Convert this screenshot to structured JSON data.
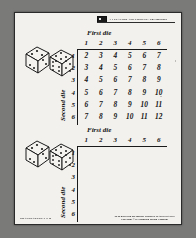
{
  "page": {
    "header": {
      "logo_icon": "publisher-logo-icon",
      "text": "A-1 TEACHER AND STUDENT / The Publisher"
    },
    "footer_left": "TRANSPARENCY 5-B",
    "footer_right_line1": "To be used with the Teacher Edition of MATHEMATICS",
    "footer_right_line2": "Copyright © by Houghton Mifflin Company"
  },
  "tables": [
    {
      "id": "sums-table-filled",
      "title": "First die",
      "side_label": "Second die",
      "columns": [
        "1",
        "2",
        "3",
        "4",
        "5",
        "6"
      ],
      "rows": [
        "1",
        "2",
        "3",
        "4",
        "5",
        "6"
      ],
      "cells": [
        [
          "2",
          "3",
          "4",
          "5",
          "6",
          "7"
        ],
        [
          "3",
          "4",
          "5",
          "6",
          "7",
          "8"
        ],
        [
          "4",
          "5",
          "6",
          "7",
          "8",
          "9"
        ],
        [
          "5",
          "6",
          "7",
          "8",
          "9",
          "10"
        ],
        [
          "6",
          "7",
          "8",
          "9",
          "10",
          "11"
        ],
        [
          "7",
          "8",
          "9",
          "10",
          "11",
          "12"
        ]
      ],
      "dice": {
        "left_face": "3",
        "right_face": "5"
      }
    },
    {
      "id": "sums-table-blank",
      "title": "First die",
      "side_label": "Second die",
      "columns": [
        "1",
        "2",
        "3",
        "4",
        "5",
        "6"
      ],
      "rows": [
        "1",
        "2",
        "3",
        "4",
        "5",
        "6"
      ],
      "cells": [
        [
          "",
          "",
          "",
          "",
          "",
          ""
        ],
        [
          "",
          "",
          "",
          "",
          "",
          ""
        ],
        [
          "",
          "",
          "",
          "",
          "",
          ""
        ],
        [
          "",
          "",
          "",
          "",
          "",
          ""
        ],
        [
          "",
          "",
          "",
          "",
          "",
          ""
        ],
        [
          "",
          "",
          "",
          "",
          "",
          ""
        ]
      ],
      "dice": {
        "left_face": "3",
        "right_face": "5"
      }
    }
  ]
}
